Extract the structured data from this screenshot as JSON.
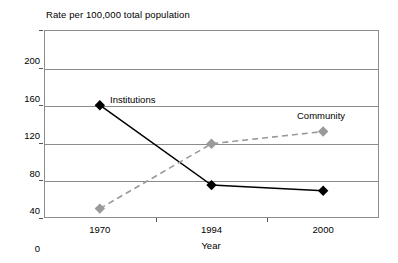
{
  "chart_data": {
    "type": "line",
    "title": "Rate per 100,000 total population",
    "xlabel": "Year",
    "ylabel": "",
    "categories": [
      "1970",
      "1994",
      "2000"
    ],
    "ylim": [
      0,
      200
    ],
    "yticks": [
      "0",
      "40",
      "80",
      "120",
      "160",
      "200"
    ],
    "grid": true,
    "legend_position": "inline-annotations",
    "series": [
      {
        "name": "Institutions",
        "values": [
          120,
          35,
          29
        ],
        "color": "#000000",
        "style": "solid",
        "marker": "diamond"
      },
      {
        "name": "Community",
        "values": [
          10,
          79,
          92
        ],
        "color": "#9a9a9a",
        "style": "dashed",
        "marker": "diamond"
      }
    ],
    "annotations": [
      {
        "text": "Institutions",
        "series": "Institutions"
      },
      {
        "text": "Community",
        "series": "Community"
      }
    ]
  }
}
